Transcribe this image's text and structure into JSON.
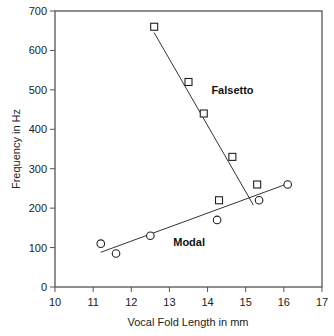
{
  "chart_data": {
    "type": "scatter",
    "title": "",
    "xlabel": "Vocal Fold Length in mm",
    "ylabel": "Frequency in Hz",
    "xlim": [
      10,
      17
    ],
    "ylim": [
      0,
      700
    ],
    "xticks": [
      10,
      11,
      12,
      13,
      14,
      15,
      16,
      17
    ],
    "yticks": [
      0,
      100,
      200,
      300,
      400,
      500,
      600,
      700
    ],
    "grid": false,
    "legend": "none (inline labels)",
    "series": [
      {
        "name": "Falsetto",
        "marker": "square",
        "points": [
          {
            "x": 12.6,
            "y": 660
          },
          {
            "x": 13.5,
            "y": 520
          },
          {
            "x": 13.9,
            "y": 440
          },
          {
            "x": 14.65,
            "y": 330
          },
          {
            "x": 15.3,
            "y": 260
          },
          {
            "x": 14.3,
            "y": 220
          }
        ],
        "fit_line": {
          "x1": 12.6,
          "y1": 645,
          "x2": 15.2,
          "y2": 208
        }
      },
      {
        "name": "Modal",
        "marker": "circle",
        "points": [
          {
            "x": 11.2,
            "y": 110
          },
          {
            "x": 11.6,
            "y": 85
          },
          {
            "x": 12.5,
            "y": 130
          },
          {
            "x": 14.25,
            "y": 170
          },
          {
            "x": 15.35,
            "y": 220
          },
          {
            "x": 16.1,
            "y": 260
          }
        ],
        "fit_line": {
          "x1": 11.2,
          "y1": 88,
          "x2": 16.1,
          "y2": 262
        }
      }
    ],
    "annotations": [
      {
        "text": "Falsetto",
        "x": 14.1,
        "y": 490
      },
      {
        "text": "Modal",
        "x": 13.1,
        "y": 105
      }
    ]
  }
}
